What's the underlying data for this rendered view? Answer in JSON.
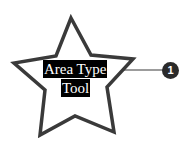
{
  "diagram": {
    "shape": "star",
    "text_lines": [
      "Area Type",
      "Tool"
    ],
    "callout": {
      "number": "1"
    },
    "colors": {
      "stroke": "#3a3a3a",
      "label_bg": "#000000",
      "label_text": "#ffffff",
      "callout_bg": "#2a2a2a"
    }
  }
}
